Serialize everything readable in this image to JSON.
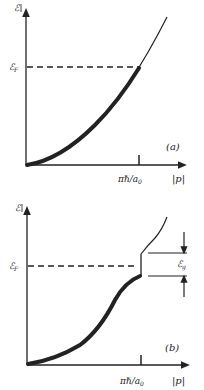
{
  "panels": [
    {
      "id": "a",
      "label": "(a)",
      "y_axis_label": "ℰ",
      "fermi_label": "ℰ",
      "fermi_sub": "F",
      "tick_label_main": "πℏ/a",
      "tick_label_sub": "0",
      "x_axis_label": "|p|"
    },
    {
      "id": "b",
      "label": "(b)",
      "y_axis_label": "ℰ",
      "fermi_label": "ℰ",
      "fermi_sub": "F",
      "gap_label": "ℰ",
      "gap_sub": "g",
      "tick_label_main": "πℏ/a",
      "tick_label_sub": "0",
      "x_axis_label": "|p|"
    }
  ],
  "colors": {
    "ink": "#222222",
    "background": "#ffffff"
  }
}
